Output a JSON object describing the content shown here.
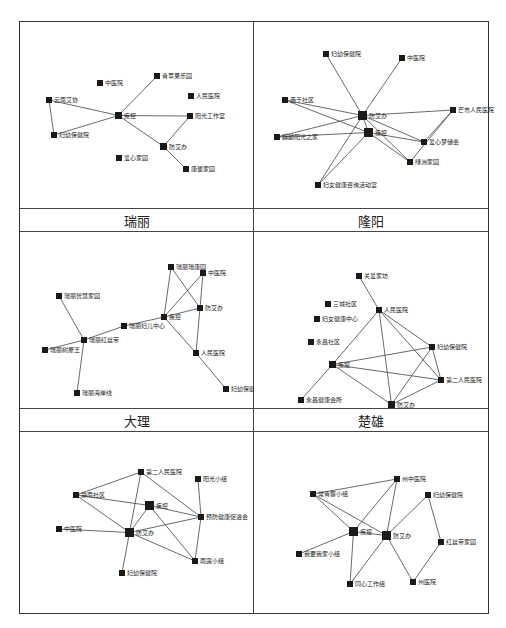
{
  "figure": {
    "panels": [
      {
        "id": "p1",
        "label": "瑞丽",
        "nodes": [
          {
            "id": "qingnian",
            "label": "青苹果乐园",
            "x": 116,
            "y": 37,
            "s": 6
          },
          {
            "id": "zhongyi",
            "label": "中医院",
            "x": 59,
            "y": 44,
            "s": 6
          },
          {
            "id": "yunnan",
            "label": "云南艾协",
            "x": 8,
            "y": 61,
            "s": 6
          },
          {
            "id": "renmin",
            "label": "人民医院",
            "x": 150,
            "y": 57,
            "s": 6
          },
          {
            "id": "jikong",
            "label": "疾控",
            "x": 77,
            "y": 76,
            "s": 7
          },
          {
            "id": "yangguang",
            "label": "阳光工作室",
            "x": 149,
            "y": 77,
            "s": 6
          },
          {
            "id": "fuyou",
            "label": "妇幼保健院",
            "x": 13,
            "y": 96,
            "s": 6
          },
          {
            "id": "fangai",
            "label": "防艾办",
            "x": 122,
            "y": 107,
            "s": 7
          },
          {
            "id": "aixin",
            "label": "爱心家园",
            "x": 78,
            "y": 119,
            "s": 6
          },
          {
            "id": "kangfu",
            "label": "康馨家园",
            "x": 145,
            "y": 130,
            "s": 6
          }
        ],
        "edges": [
          [
            "jikong",
            "qingnian"
          ],
          [
            "yunnan",
            "jikong"
          ],
          [
            "fuyou",
            "jikong"
          ],
          [
            "fuyou",
            "yunnan"
          ],
          [
            "jikong",
            "yangguang"
          ],
          [
            "jikong",
            "fangai"
          ],
          [
            "fangai",
            "yangguang"
          ],
          [
            "kangfu",
            "fangai"
          ]
        ]
      },
      {
        "id": "p2",
        "label": "隆阳",
        "nodes": [
          {
            "id": "fuyou",
            "label": "妇幼保健院",
            "x": 51,
            "y": 15,
            "s": 6
          },
          {
            "id": "zhongyi",
            "label": "中医院",
            "x": 127,
            "y": 19,
            "s": 6
          },
          {
            "id": "xiqian",
            "label": "西干社区",
            "x": 10,
            "y": 61,
            "s": 6
          },
          {
            "id": "fangai",
            "label": "防艾办",
            "x": 86,
            "y": 75,
            "s": 9
          },
          {
            "id": "mangshi",
            "label": "芒市人民医院",
            "x": 178,
            "y": 71,
            "s": 6
          },
          {
            "id": "qilin",
            "label": "麒麟阳光之家",
            "x": 2,
            "y": 98,
            "s": 6
          },
          {
            "id": "jikong",
            "label": "疾控",
            "x": 92,
            "y": 92,
            "s": 9
          },
          {
            "id": "aixinmeng",
            "label": "爱心梦储会",
            "x": 149,
            "y": 103,
            "s": 6
          },
          {
            "id": "lvzhou",
            "label": "绿洲家园",
            "x": 135,
            "y": 123,
            "s": 6
          },
          {
            "id": "funv",
            "label": "妇女健康咨询活动室",
            "x": 43,
            "y": 146,
            "s": 6
          }
        ],
        "edges": [
          [
            "fuyou",
            "fangai"
          ],
          [
            "zhongyi",
            "fangai"
          ],
          [
            "xiqian",
            "fangai"
          ],
          [
            "xiqian",
            "jikong"
          ],
          [
            "qilin",
            "fangai"
          ],
          [
            "qilin",
            "jikong"
          ],
          [
            "fangai",
            "mangshi"
          ],
          [
            "fangai",
            "jikong"
          ],
          [
            "fangai",
            "aixinmeng"
          ],
          [
            "fangai",
            "lvzhou"
          ],
          [
            "jikong",
            "aixinmeng"
          ],
          [
            "jikong",
            "lvzhou"
          ],
          [
            "funv",
            "fangai"
          ],
          [
            "funv",
            "jikong"
          ],
          [
            "aixinmeng",
            "mangshi"
          ],
          [
            "lvzhou",
            "mangshi"
          ]
        ]
      },
      {
        "id": "p3",
        "label": "大理",
        "nodes": [
          {
            "id": "ruijin",
            "label": "瑞丽瑞康园",
            "x": 130,
            "y": 18,
            "s": 6
          },
          {
            "id": "zhongyi",
            "label": "中医院",
            "x": 162,
            "y": 24,
            "s": 6
          },
          {
            "id": "ruijiaxiang",
            "label": "瑞丽智慧家园",
            "x": 18,
            "y": 47,
            "s": 6
          },
          {
            "id": "fangai",
            "label": "防艾办",
            "x": 159,
            "y": 59,
            "s": 6
          },
          {
            "id": "jikong",
            "label": "疾控",
            "x": 123,
            "y": 68,
            "s": 6
          },
          {
            "id": "fuer",
            "label": "瑞丽妇儿中心",
            "x": 83,
            "y": 77,
            "s": 6
          },
          {
            "id": "hongsi",
            "label": "瑞丽红丝带",
            "x": 43,
            "y": 91,
            "s": 6
          },
          {
            "id": "shuli",
            "label": "瑞丽树屋王",
            "x": 4,
            "y": 101,
            "s": 6
          },
          {
            "id": "renmin",
            "label": "人民医院",
            "x": 155,
            "y": 104,
            "s": 6
          },
          {
            "id": "haian",
            "label": "瑞丽海岸线",
            "x": 36,
            "y": 144,
            "s": 6
          },
          {
            "id": "fuyou",
            "label": "妇幼保健院",
            "x": 185,
            "y": 140,
            "s": 6
          }
        ],
        "edges": [
          [
            "hongsi",
            "ruijiaxiang"
          ],
          [
            "hongsi",
            "fuer"
          ],
          [
            "shuli",
            "hongsi"
          ],
          [
            "hongsi",
            "haian"
          ],
          [
            "fuer",
            "jikong"
          ],
          [
            "ruijin",
            "jikong"
          ],
          [
            "ruijin",
            "fangai"
          ],
          [
            "zhongyi",
            "jikong"
          ],
          [
            "zhongyi",
            "fangai"
          ],
          [
            "jikong",
            "fangai"
          ],
          [
            "renmin",
            "jikong"
          ],
          [
            "renmin",
            "fangai"
          ],
          [
            "renmin",
            "fuyou"
          ]
        ]
      },
      {
        "id": "p4",
        "label": "楚雄",
        "nodes": [
          {
            "id": "guanai",
            "label": "关爱家坊",
            "x": 84,
            "y": 27,
            "s": 6
          },
          {
            "id": "sancheng",
            "label": "三城社区",
            "x": 53,
            "y": 55,
            "s": 6
          },
          {
            "id": "renmin",
            "label": "人民医院",
            "x": 104,
            "y": 61,
            "s": 6
          },
          {
            "id": "funv",
            "label": "妇女健康中心",
            "x": 42,
            "y": 70,
            "s": 6
          },
          {
            "id": "yongchang",
            "label": "永昌社区",
            "x": 36,
            "y": 93,
            "s": 6
          },
          {
            "id": "fuyou",
            "label": "妇幼保健院",
            "x": 157,
            "y": 98,
            "s": 6
          },
          {
            "id": "jikong",
            "label": "疾控",
            "x": 57,
            "y": 115,
            "s": 7
          },
          {
            "id": "dier",
            "label": "第二人民医院",
            "x": 166,
            "y": 131,
            "s": 6
          },
          {
            "id": "yongchangjk",
            "label": "永昌健康会所",
            "x": 26,
            "y": 151,
            "s": 6
          },
          {
            "id": "fangai",
            "label": "防艾办",
            "x": 116,
            "y": 155,
            "s": 7
          }
        ],
        "edges": [
          [
            "guanai",
            "renmin"
          ],
          [
            "renmin",
            "jikong"
          ],
          [
            "renmin",
            "fangai"
          ],
          [
            "renmin",
            "fuyou"
          ],
          [
            "renmin",
            "dier"
          ],
          [
            "jikong",
            "fuyou"
          ],
          [
            "jikong",
            "dier"
          ],
          [
            "jikong",
            "fangai"
          ],
          [
            "yongchangjk",
            "jikong"
          ],
          [
            "fuyou",
            "fangai"
          ],
          [
            "dier",
            "fuyou"
          ],
          [
            "dier",
            "fangai"
          ]
        ]
      },
      {
        "id": "p5",
        "label": "",
        "nodes": [
          {
            "id": "dier",
            "label": "第二人民医院",
            "x": 100,
            "y": 23,
            "s": 6
          },
          {
            "id": "yangguang",
            "label": "阳光小组",
            "x": 157,
            "y": 30,
            "s": 6
          },
          {
            "id": "jingnan",
            "label": "静南社区",
            "x": 35,
            "y": 46,
            "s": 6
          },
          {
            "id": "jikong",
            "label": "疾控",
            "x": 107,
            "y": 55,
            "s": 9
          },
          {
            "id": "yufang",
            "label": "预防健康促进会",
            "x": 160,
            "y": 68,
            "s": 6
          },
          {
            "id": "zhongyi",
            "label": "中医院",
            "x": 18,
            "y": 80,
            "s": 6
          },
          {
            "id": "fangai",
            "label": "防艾办",
            "x": 87,
            "y": 82,
            "s": 9
          },
          {
            "id": "yulu",
            "label": "雨露小组",
            "x": 154,
            "y": 112,
            "s": 6
          },
          {
            "id": "fuyou",
            "label": "妇幼保健院",
            "x": 81,
            "y": 124,
            "s": 6
          }
        ],
        "edges": [
          [
            "jingnan",
            "dier"
          ],
          [
            "jingnan",
            "jikong"
          ],
          [
            "jingnan",
            "fangai"
          ],
          [
            "fangai",
            "dier"
          ],
          [
            "yufang",
            "dier"
          ],
          [
            "yufang",
            "yangguang"
          ],
          [
            "yufang",
            "jikong"
          ],
          [
            "yufang",
            "fangai"
          ],
          [
            "yufang",
            "yulu"
          ],
          [
            "yulu",
            "jikong"
          ],
          [
            "yulu",
            "fangai"
          ],
          [
            "zhongyi",
            "fangai"
          ],
          [
            "fangai",
            "jikong"
          ],
          [
            "fangai",
            "fuyou"
          ]
        ]
      },
      {
        "id": "p6",
        "label": "",
        "nodes": [
          {
            "id": "zhouzhong",
            "label": "州中医院",
            "x": 122,
            "y": 30,
            "s": 6
          },
          {
            "id": "changqing",
            "label": "常青藤小组",
            "x": 38,
            "y": 45,
            "s": 6
          },
          {
            "id": "fuyou",
            "label": "妇幼保健院",
            "x": 153,
            "y": 46,
            "s": 6
          },
          {
            "id": "jikong",
            "label": "疾控",
            "x": 77,
            "y": 81,
            "s": 9
          },
          {
            "id": "fangai",
            "label": "防艾办",
            "x": 110,
            "y": 85,
            "s": 9
          },
          {
            "id": "hongsi",
            "label": "红丝带家园",
            "x": 166,
            "y": 93,
            "s": 6
          },
          {
            "id": "woyao",
            "label": "我要我家小组",
            "x": 24,
            "y": 105,
            "s": 6
          },
          {
            "id": "tongxin",
            "label": "同心工作组",
            "x": 75,
            "y": 135,
            "s": 6
          },
          {
            "id": "zhouyi",
            "label": "州医院",
            "x": 138,
            "y": 133,
            "s": 6
          }
        ],
        "edges": [
          [
            "changqing",
            "zhouzhong"
          ],
          [
            "changqing",
            "jikong"
          ],
          [
            "changqing",
            "fangai"
          ],
          [
            "zhouzhong",
            "jikong"
          ],
          [
            "zhouzhong",
            "fangai"
          ],
          [
            "jikong",
            "fangai"
          ],
          [
            "woyao",
            "jikong"
          ],
          [
            "tongxin",
            "jikong"
          ],
          [
            "tongxin",
            "fangai"
          ],
          [
            "fuyou",
            "fangai"
          ],
          [
            "fuyou",
            "hongsi"
          ],
          [
            "fangai",
            "zhouyi"
          ],
          [
            "hongsi",
            "zhouyi"
          ]
        ]
      }
    ]
  }
}
